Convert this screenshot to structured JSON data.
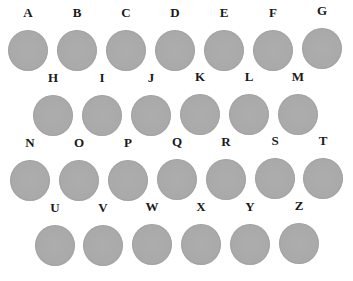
{
  "samples": [
    {
      "label": "A",
      "x": 6,
      "y": 5
    },
    {
      "label": "B",
      "x": 55,
      "y": 5
    },
    {
      "label": "C",
      "x": 104,
      "y": 5
    },
    {
      "label": "D",
      "x": 153,
      "y": 5
    },
    {
      "label": "E",
      "x": 202,
      "y": 5
    },
    {
      "label": "F",
      "x": 251,
      "y": 5
    },
    {
      "label": "G",
      "x": 300,
      "y": 3
    },
    {
      "label": "H",
      "x": 31,
      "y": 70
    },
    {
      "label": "I",
      "x": 80,
      "y": 70
    },
    {
      "label": "J",
      "x": 129,
      "y": 70
    },
    {
      "label": "K",
      "x": 178,
      "y": 69
    },
    {
      "label": "L",
      "x": 227,
      "y": 69
    },
    {
      "label": "M",
      "x": 276,
      "y": 69
    },
    {
      "label": "N",
      "x": 8,
      "y": 135
    },
    {
      "label": "O",
      "x": 57,
      "y": 135
    },
    {
      "label": "P",
      "x": 106,
      "y": 135
    },
    {
      "label": "Q",
      "x": 155,
      "y": 134
    },
    {
      "label": "R",
      "x": 204,
      "y": 134
    },
    {
      "label": "S",
      "x": 253,
      "y": 133
    },
    {
      "label": "T",
      "x": 301,
      "y": 133
    },
    {
      "label": "U",
      "x": 33,
      "y": 200
    },
    {
      "label": "V",
      "x": 81,
      "y": 200
    },
    {
      "label": "W",
      "x": 130,
      "y": 199
    },
    {
      "label": "X",
      "x": 179,
      "y": 199
    },
    {
      "label": "Y",
      "x": 228,
      "y": 199
    },
    {
      "label": "Z",
      "x": 277,
      "y": 198
    }
  ],
  "colors": {
    "disc": "#a9a9a9",
    "label": "#1a1a1a",
    "background": "#ffffff"
  }
}
